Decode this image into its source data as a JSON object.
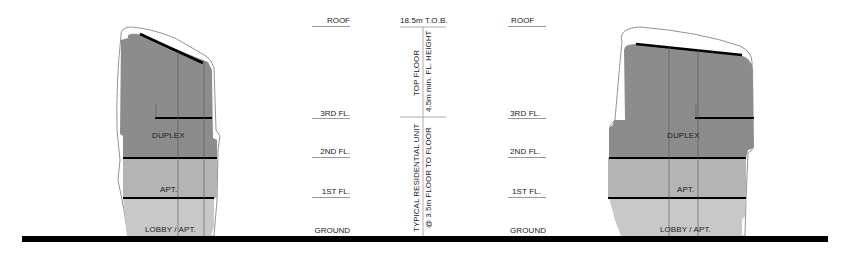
{
  "colors": {
    "duplex_fill": "#8c8c8c",
    "apt_fill": "#b4b4b4",
    "lobby_fill": "#c8c8c8",
    "outline": "#555555",
    "ground": "#000000",
    "level_line": "#9a9a9a",
    "text": "#222222"
  },
  "left_building": {
    "labels": {
      "duplex": "DUPLEX",
      "apt": "APT.",
      "lobby": "LOBBY / APT."
    }
  },
  "right_building": {
    "labels": {
      "duplex": "DUPLEX",
      "apt": "APT.",
      "lobby": "LOBBY / APT."
    }
  },
  "left_levels": [
    {
      "label": "ROOF"
    },
    {
      "label": "3RD FL."
    },
    {
      "label": "2ND FL."
    },
    {
      "label": "1ST FL."
    },
    {
      "label": "GROUND"
    }
  ],
  "right_levels": [
    {
      "label": "ROOF"
    },
    {
      "label": "3RD FL."
    },
    {
      "label": "2ND FL."
    },
    {
      "label": "1ST FL."
    },
    {
      "label": "GROUND"
    }
  ],
  "dimension": {
    "top_label": "18.5m T.O.B.",
    "top_floor_line1": "TOP FLOOR",
    "top_floor_line2": "4.5m min. FL. HEIGHT",
    "typical_line1": "TYPICAL RESIDENTIAL UNIT",
    "typical_line2": "@ 3.5m FLOOR TO FLOOR"
  }
}
